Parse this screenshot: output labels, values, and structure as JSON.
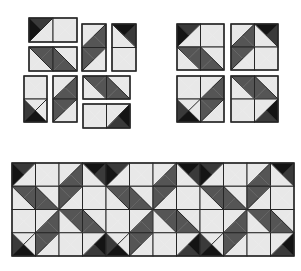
{
  "diagram": {
    "colors": {
      "L": "#e8e8e8",
      "M": "#555555",
      "G": "#3a3a3a",
      "K": "#141414",
      "line": "#262626",
      "background": "#ffffff"
    },
    "legend": {
      "L": "light fabric",
      "M": "medium fabric",
      "G": "dark grey fabric",
      "K": "black fabric"
    },
    "motif": [
      [
        {
          "q": [
            "G",
            "L",
            "L",
            "K"
          ],
          "d": "tr-bl"
        },
        {
          "q": [
            "L",
            "L",
            "L",
            "L"
          ],
          "d": null
        },
        {
          "q": [
            "L",
            "M",
            "M",
            "L"
          ],
          "d": "tr-bl"
        },
        {
          "q": [
            "K",
            "G",
            "L",
            "L"
          ],
          "d": "tl-br"
        }
      ],
      [
        {
          "q": [
            "M",
            "M",
            "L",
            "L"
          ],
          "d": "tl-br"
        },
        {
          "q": [
            "L",
            "L",
            "M",
            "M"
          ],
          "d": "tl-br"
        },
        {
          "q": [
            "M",
            "L",
            "L",
            "M"
          ],
          "d": "tr-bl"
        },
        {
          "q": [
            "L",
            "L",
            "L",
            "L"
          ],
          "d": null
        }
      ],
      [
        {
          "q": [
            "L",
            "L",
            "L",
            "L"
          ],
          "d": null
        },
        {
          "q": [
            "L",
            "M",
            "M",
            "L"
          ],
          "d": "tr-bl"
        },
        {
          "q": [
            "M",
            "M",
            "L",
            "L"
          ],
          "d": "tl-br"
        },
        {
          "q": [
            "L",
            "L",
            "M",
            "M"
          ],
          "d": "tl-br"
        }
      ],
      [
        {
          "q": [
            "L",
            "L",
            "K",
            "G"
          ],
          "d": "tr-bl"
        },
        {
          "q": [
            "M",
            "L",
            "L",
            "M"
          ],
          "d": "tr-bl"
        },
        {
          "q": [
            "L",
            "L",
            "L",
            "L"
          ],
          "d": null
        },
        {
          "q": [
            "L",
            "K",
            "G",
            "L"
          ],
          "d": "tr-bl"
        }
      ]
    ],
    "pieces": [
      {
        "name": "piece-1-corner-square-pair",
        "x": 29,
        "y": 18,
        "w": 48,
        "h": 24,
        "cells": [
          [
            [
              0,
              0
            ],
            [
              0,
              1
            ]
          ]
        ]
      },
      {
        "name": "piece-2-band-pair",
        "x": 29,
        "y": 47,
        "w": 48,
        "h": 24,
        "cells": [
          [
            [
              1,
              0
            ],
            [
              1,
              1
            ]
          ]
        ]
      },
      {
        "name": "piece-3-vertical-band",
        "x": 82,
        "y": 24,
        "w": 24,
        "h": 47,
        "cells": [
          [
            [
              0,
              2
            ]
          ],
          [
            [
              1,
              2
            ]
          ]
        ]
      },
      {
        "name": "piece-4-corner-square-vertical",
        "x": 112,
        "y": 24,
        "w": 24,
        "h": 47,
        "cells": [
          [
            [
              0,
              3
            ]
          ],
          [
            [
              1,
              3
            ]
          ]
        ]
      },
      {
        "name": "piece-5-square-corner-vertical",
        "x": 24,
        "y": 76,
        "w": 23,
        "h": 46,
        "cells": [
          [
            [
              2,
              0
            ]
          ],
          [
            [
              3,
              0
            ]
          ]
        ]
      },
      {
        "name": "piece-6-vertical-band",
        "x": 53,
        "y": 76,
        "w": 24,
        "h": 46,
        "cells": [
          [
            [
              2,
              1
            ]
          ],
          [
            [
              3,
              1
            ]
          ]
        ]
      },
      {
        "name": "piece-7-band-pair",
        "x": 83,
        "y": 76,
        "w": 47,
        "h": 23,
        "cells": [
          [
            [
              2,
              2
            ],
            [
              2,
              3
            ]
          ]
        ]
      },
      {
        "name": "piece-8-square-corner-pair",
        "x": 83,
        "y": 104,
        "w": 47,
        "h": 24,
        "cells": [
          [
            [
              3,
              2
            ],
            [
              3,
              3
            ]
          ]
        ]
      }
    ],
    "blocks": [
      {
        "name": "block-top-left",
        "x": 177,
        "y": 24,
        "w": 47,
        "h": 46,
        "cells": [
          [
            [
              0,
              0
            ],
            [
              0,
              1
            ]
          ],
          [
            [
              1,
              0
            ],
            [
              1,
              1
            ]
          ]
        ]
      },
      {
        "name": "block-top-right",
        "x": 231,
        "y": 24,
        "w": 47,
        "h": 46,
        "cells": [
          [
            [
              0,
              2
            ],
            [
              0,
              3
            ]
          ],
          [
            [
              1,
              2
            ],
            [
              1,
              3
            ]
          ]
        ]
      },
      {
        "name": "block-bottom-left",
        "x": 177,
        "y": 76,
        "w": 47,
        "h": 46,
        "cells": [
          [
            [
              2,
              0
            ],
            [
              2,
              1
            ]
          ],
          [
            [
              3,
              0
            ],
            [
              3,
              1
            ]
          ]
        ]
      },
      {
        "name": "block-bottom-right",
        "x": 231,
        "y": 76,
        "w": 47,
        "h": 46,
        "cells": [
          [
            [
              2,
              2
            ],
            [
              2,
              3
            ]
          ],
          [
            [
              3,
              2
            ],
            [
              3,
              3
            ]
          ]
        ]
      }
    ],
    "strip": {
      "name": "assembled-quilt-strip",
      "x": 12,
      "y": 163,
      "w": 282,
      "h": 93,
      "repeats": 3,
      "rows": 4,
      "cols": 12
    }
  }
}
